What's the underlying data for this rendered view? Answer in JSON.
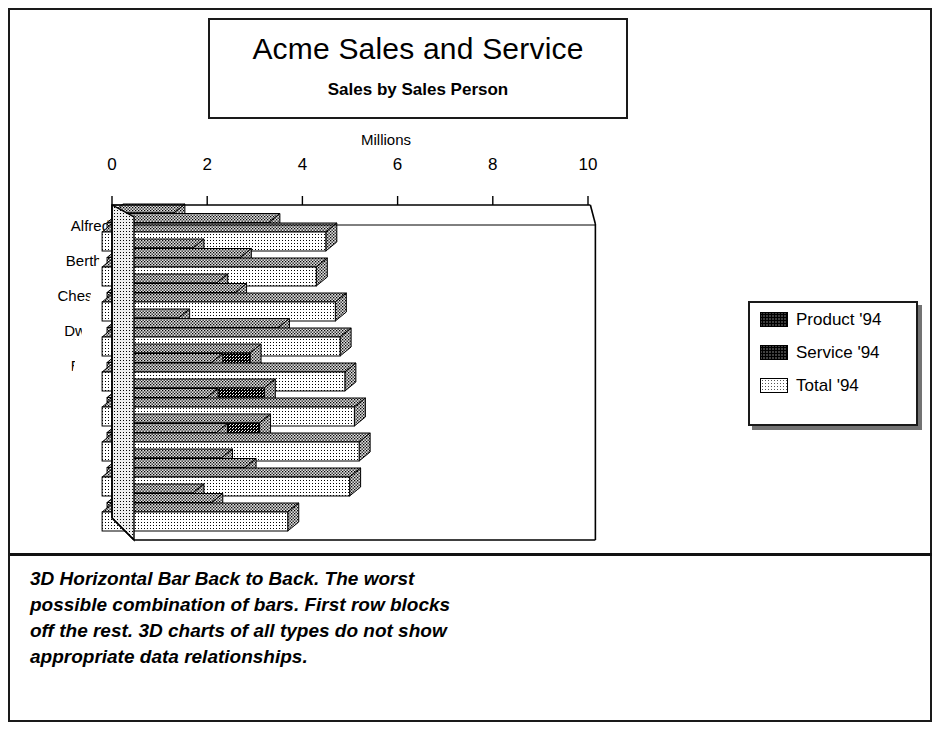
{
  "title": {
    "main": "Acme Sales and Service",
    "sub": "Sales by Sales Person"
  },
  "caption": {
    "lines": [
      "3D Horizontal Bar Back to Back. The worst",
      "possible combination of bars. First row blocks",
      "off the rest. 3D charts of all types do not show",
      "appropriate data relationships."
    ]
  },
  "legend": {
    "items": [
      {
        "label": "Product '94",
        "pattern": "pat-product",
        "color": "#1a1a1a"
      },
      {
        "label": "Service '94",
        "pattern": "pat-service",
        "color": "#555555"
      },
      {
        "label": "Total '94",
        "pattern": "pat-total",
        "color": "#e8e8e8"
      }
    ]
  },
  "chart_data": {
    "type": "bar",
    "orientation": "horizontal",
    "style": "3d-back-to-back",
    "title": "Acme Sales and Service",
    "subtitle": "Sales by Sales Person",
    "xlabel": "Millions",
    "ylabel": "",
    "xlim": [
      0,
      10
    ],
    "xticks": [
      0,
      2,
      4,
      6,
      8,
      10
    ],
    "xtick_labels": [
      "0",
      "2",
      "4",
      "6",
      "8",
      "10"
    ],
    "grid": false,
    "legend_position": "right",
    "categories": [
      "Alfred",
      "Bertha",
      "Chester",
      "Dwight",
      "Elmer",
      "Fred",
      "Gerald",
      "Herbert",
      "Iggy"
    ],
    "series": [
      {
        "name": "Product '94",
        "values": [
          1.3,
          1.7,
          2.2,
          1.4,
          2.9,
          3.2,
          3.1,
          2.3,
          1.7
        ]
      },
      {
        "name": "Service '94",
        "values": [
          3.4,
          2.8,
          2.7,
          3.6,
          2.2,
          2.1,
          2.3,
          2.9,
          2.2
        ]
      },
      {
        "name": "Total '94",
        "values": [
          4.7,
          4.5,
          4.9,
          5.0,
          5.1,
          5.3,
          5.4,
          5.2,
          3.9
        ]
      }
    ]
  },
  "geometry": {
    "units_per_px": 47.6,
    "origin_x": 112,
    "origin_y": 205,
    "depth_dx": -9,
    "depth_dy": 13,
    "row_height": 35,
    "bar_height": 19
  }
}
